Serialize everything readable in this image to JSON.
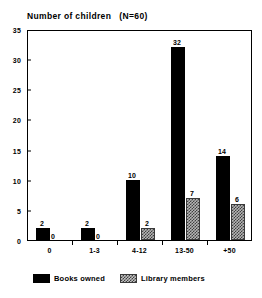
{
  "chart_data": {
    "type": "bar",
    "title": "Number of children   (N=60)",
    "xlabel": "",
    "ylabel": "",
    "categories": [
      "0",
      "1-3",
      "4-12",
      "13-50",
      "+50"
    ],
    "series": [
      {
        "name": "Books owned",
        "values": [
          2,
          2,
          10,
          32,
          14
        ],
        "color": "#000000"
      },
      {
        "name": "Library members",
        "values": [
          0,
          0,
          2,
          7,
          6
        ],
        "color": "#b4b4b4"
      }
    ],
    "yticks": [
      0,
      5,
      10,
      15,
      20,
      25,
      30,
      35
    ],
    "ylim": [
      0,
      35
    ],
    "grid": false,
    "legend_position": "bottom",
    "data_labels": true
  },
  "legend": {
    "entries": [
      {
        "label": "Books owned",
        "swatch": "solid-black-swatch"
      },
      {
        "label": "Library members",
        "swatch": "hatched-gray-swatch"
      }
    ]
  }
}
